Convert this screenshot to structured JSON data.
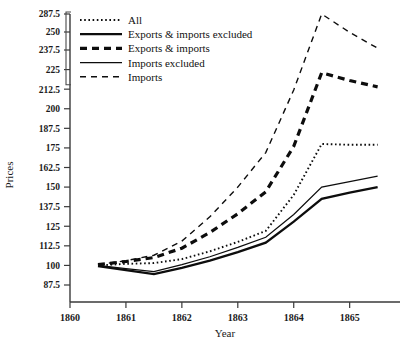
{
  "chart_data": {
    "type": "line",
    "title": "",
    "xlabel": "Year",
    "ylabel": "Prices",
    "xlim": [
      1860,
      1865.9
    ],
    "ylim": [
      80,
      291
    ],
    "grid": false,
    "legend_position": "top-left",
    "x": [
      1860.5,
      1861.0,
      1861.5,
      1862.0,
      1862.5,
      1863.0,
      1863.5,
      1864.0,
      1864.5,
      1865.0,
      1865.5
    ],
    "xticks": [
      1860,
      1861,
      1862,
      1863,
      1864,
      1865
    ],
    "xtick_labels": [
      "1860",
      "1861",
      "1862",
      "1863",
      "1864",
      "1865"
    ],
    "yticks": [
      87.5,
      100,
      112.5,
      125,
      137.5,
      150,
      162.5,
      175,
      187.5,
      200,
      212.5,
      225,
      237.5,
      262.5,
      287.5
    ],
    "ytick_labels": [
      "87.5",
      "100",
      "112.5",
      "125",
      "137.5",
      "150",
      "162.5",
      "175",
      "187.5",
      "200",
      "212.5",
      "225",
      "237.5",
      "250",
      "287.5"
    ],
    "series": [
      {
        "name": "All",
        "style": "dotted",
        "width": 1.9,
        "values": [
          100,
          101,
          101.5,
          104,
          109,
          115,
          122,
          145,
          177.5,
          177,
          177
        ]
      },
      {
        "name": "Exports & imports excluded",
        "style": "solid-thick",
        "width": 2.3,
        "values": [
          99.5,
          97,
          94.5,
          98.5,
          103,
          108.5,
          114.5,
          128,
          142.5,
          146.5,
          150
        ]
      },
      {
        "name": "Exports & imports",
        "style": "dashed-thick",
        "width": 3.2,
        "values": [
          100.5,
          102.5,
          105,
          111,
          121,
          133,
          147,
          176,
          223,
          218,
          214
        ]
      },
      {
        "name": "Imports excluded",
        "style": "solid-thin",
        "width": 1.2,
        "values": [
          100,
          98,
          96,
          100.5,
          105.5,
          111.5,
          118,
          132.5,
          150,
          153.5,
          157
        ]
      },
      {
        "name": "Imports",
        "style": "dashed-thin",
        "width": 1.4,
        "values": [
          100.5,
          103,
          106.5,
          115.5,
          131,
          150,
          172,
          212,
          287.5,
          262,
          240
        ]
      }
    ]
  },
  "axes": {
    "y_axis_title": "Prices",
    "x_axis_title": "Year"
  },
  "legend": {
    "items": [
      {
        "label": "All",
        "style": "dotted"
      },
      {
        "label": "Exports & imports excluded",
        "style": "solid-thick"
      },
      {
        "label": "Exports & imports",
        "style": "dashed-thick"
      },
      {
        "label": "Imports excluded",
        "style": "solid-thin"
      },
      {
        "label": "Imports",
        "style": "dashed-thin"
      }
    ]
  },
  "colors": {
    "line": "#0d0d0d",
    "axis": "#3a3a3a",
    "text": "#1a1a1a",
    "background": "#ffffff"
  }
}
